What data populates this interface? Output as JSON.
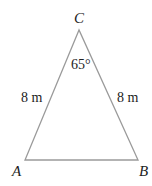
{
  "diagram": {
    "type": "isosceles-triangle",
    "vertices": {
      "A": {
        "label": "A"
      },
      "B": {
        "label": "B"
      },
      "C": {
        "label": "C"
      }
    },
    "sides": {
      "CA": {
        "label": "8 m"
      },
      "CB": {
        "label": "8 m"
      }
    },
    "angles": {
      "C": {
        "label": "65°"
      }
    },
    "colors": {
      "stroke": "#9a9a9a",
      "text": "#222222"
    }
  }
}
